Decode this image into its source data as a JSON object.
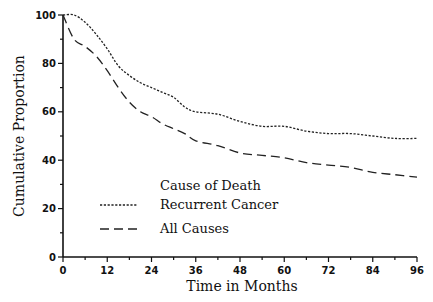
{
  "chart_data": {
    "type": "line",
    "title": "",
    "xlabel": "Time in Months",
    "ylabel": "Cumulative Proportion",
    "xlim": [
      0,
      96
    ],
    "ylim": [
      0,
      100
    ],
    "x_ticks": [
      0,
      12,
      24,
      36,
      48,
      60,
      72,
      84,
      96
    ],
    "y_ticks": [
      0,
      20,
      40,
      60,
      80,
      100
    ],
    "grid": false,
    "legend": {
      "title": "Cause of Death",
      "position": "inside lower-left",
      "entries": [
        {
          "label": "Recurrent Cancer",
          "style": "dotted"
        },
        {
          "label": "All Causes",
          "style": "dashed"
        }
      ]
    },
    "series": [
      {
        "name": "Recurrent Cancer",
        "style": "dotted",
        "x": [
          0,
          3,
          6,
          9,
          12,
          15,
          18,
          21,
          24,
          27,
          30,
          33,
          36,
          42,
          48,
          54,
          60,
          66,
          72,
          78,
          84,
          90,
          96
        ],
        "y": [
          100,
          100,
          97,
          92,
          86,
          79,
          75,
          72,
          70,
          68,
          66,
          62,
          60,
          59,
          56,
          54,
          54,
          52,
          51,
          51,
          50,
          49,
          49
        ]
      },
      {
        "name": "All Causes",
        "style": "dashed",
        "x": [
          0,
          3,
          6,
          9,
          12,
          15,
          18,
          21,
          24,
          27,
          30,
          33,
          36,
          42,
          48,
          54,
          60,
          66,
          72,
          78,
          84,
          90,
          96
        ],
        "y": [
          100,
          90,
          87,
          83,
          77,
          70,
          64,
          60,
          58,
          55,
          53,
          51,
          48,
          46,
          43,
          42,
          41,
          39,
          38,
          37,
          35,
          34,
          33
        ]
      }
    ]
  }
}
